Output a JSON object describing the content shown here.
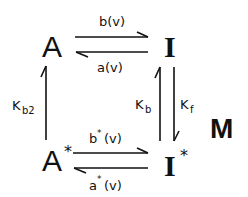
{
  "diagram": {
    "nodes": {
      "A": {
        "label": "A",
        "star": ""
      },
      "I": {
        "label": "I",
        "star": ""
      },
      "A_star": {
        "label": "A",
        "star": "*"
      },
      "I_star": {
        "label": "I",
        "star": "*"
      }
    },
    "side_label": "M",
    "edges": {
      "top_forward": {
        "from": "A",
        "to": "I",
        "label": "b(v)"
      },
      "top_backward": {
        "from": "I",
        "to": "A",
        "label": "a(v)"
      },
      "bottom_forward": {
        "from": "A*",
        "to": "I*",
        "label_main": "b",
        "label_star": "*",
        "label_arg": "(v)"
      },
      "bottom_backward": {
        "from": "I*",
        "to": "A*",
        "label_main": "a",
        "label_star": "*",
        "label_arg": "(v)"
      },
      "left_up": {
        "from": "A*",
        "to": "A",
        "label_main": "K",
        "label_sub": "b2"
      },
      "right_up": {
        "from": "I*",
        "to": "I",
        "label_main": "K",
        "label_sub": "b"
      },
      "right_down": {
        "from": "I",
        "to": "I*",
        "label_main": "K",
        "label_sub": "f"
      }
    }
  }
}
